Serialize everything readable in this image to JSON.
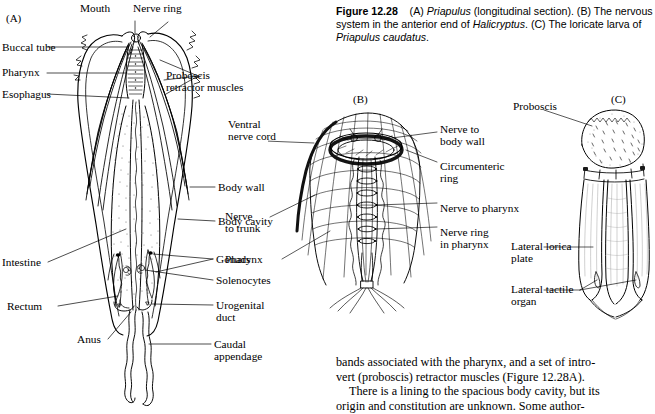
{
  "figure": {
    "number": "Figure 12.28",
    "caption_parts": [
      {
        "t": "(A) ",
        "style": "plain"
      },
      {
        "t": "Priapulus",
        "style": "italic"
      },
      {
        "t": " (longitudinal section). (B) The nervous system in the anterior end of ",
        "style": "plain"
      },
      {
        "t": "Halicryptus",
        "style": "italic"
      },
      {
        "t": ". (C) The loricate larva of ",
        "style": "plain"
      },
      {
        "t": "Priapulus caudatus",
        "style": "italic"
      },
      {
        "t": ".",
        "style": "plain"
      }
    ],
    "caption_plain": "Figure 12.28 (A) Priapulus (longitudinal section). (B) The nervous system in the anterior end of Halicryptus. (C) The loricate larva of Priapulus caudatus."
  },
  "body_text": {
    "line1": "bands associated with the pharynx, and a set of intro-",
    "line2": "vert (proboscis) retractor muscles (Figure 12.28A).",
    "line3": "There is a lining to the spacious body cavity, but its",
    "line4": "origin and constitution are unknown. Some author-"
  },
  "panels": {
    "a": {
      "id": "(A)",
      "labels": [
        {
          "key": "mouth",
          "text": "Mouth"
        },
        {
          "key": "nerve_ring",
          "text": "Nerve ring"
        },
        {
          "key": "buccal_tube",
          "text": "Buccal tube"
        },
        {
          "key": "pharynx",
          "text": "Pharynx"
        },
        {
          "key": "esophagus",
          "text": "Esophagus"
        },
        {
          "key": "proboscis_retractor_1",
          "text": "Proboscis"
        },
        {
          "key": "proboscis_retractor_2",
          "text": "retractor muscles"
        },
        {
          "key": "body_wall",
          "text": "Body wall"
        },
        {
          "key": "body_cavity",
          "text": "Body cavity"
        },
        {
          "key": "intestine",
          "text": "Intestine"
        },
        {
          "key": "gonads",
          "text": "Gonads"
        },
        {
          "key": "solenocytes",
          "text": "Solenocytes"
        },
        {
          "key": "urogenital_1",
          "text": "Urogenital"
        },
        {
          "key": "urogenital_2",
          "text": "duct"
        },
        {
          "key": "rectum",
          "text": "Rectum"
        },
        {
          "key": "anus",
          "text": "Anus"
        },
        {
          "key": "caudal_1",
          "text": "Caudal"
        },
        {
          "key": "caudal_2",
          "text": "appendage"
        }
      ]
    },
    "b": {
      "id": "(B)",
      "labels": [
        {
          "key": "ventral_1",
          "text": "Ventral"
        },
        {
          "key": "ventral_2",
          "text": "nerve cord"
        },
        {
          "key": "nerve_bw_1",
          "text": "Nerve to"
        },
        {
          "key": "nerve_bw_2",
          "text": "body wall"
        },
        {
          "key": "circ_1",
          "text": "Circumenteric"
        },
        {
          "key": "circ_2",
          "text": "ring"
        },
        {
          "key": "nerve_phx",
          "text": "Nerve to pharynx"
        },
        {
          "key": "nrp_1",
          "text": "Nerve ring"
        },
        {
          "key": "nrp_2",
          "text": "in pharynx"
        },
        {
          "key": "trunk_1",
          "text": "Nerve"
        },
        {
          "key": "trunk_2",
          "text": "to trunk"
        },
        {
          "key": "pharynx",
          "text": "Pharynx"
        }
      ]
    },
    "c": {
      "id": "(C)",
      "labels": [
        {
          "key": "proboscis",
          "text": "Proboscis"
        },
        {
          "key": "lorica_1",
          "text": "Lateral lorica"
        },
        {
          "key": "lorica_2",
          "text": "plate"
        },
        {
          "key": "tactile_1",
          "text": "Lateral tactile"
        },
        {
          "key": "tactile_2",
          "text": "organ"
        }
      ]
    }
  },
  "colors": {
    "ink": "#000000",
    "page": "#ffffff",
    "stipple": "#777777"
  }
}
